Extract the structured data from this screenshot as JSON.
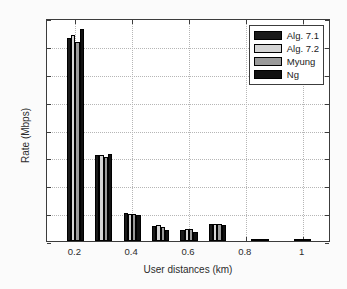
{
  "figure": {
    "width": 347,
    "height": 289,
    "background": "#fbfbfb"
  },
  "chart_data": {
    "type": "bar",
    "title": "",
    "xlabel": "User distances (km)",
    "ylabel": "Rate (Mbps)",
    "xlim": [
      0.1,
      1.1
    ],
    "ylim": [
      0,
      16
    ],
    "yticks": [
      0,
      2,
      4,
      6,
      8,
      10,
      12,
      14,
      16
    ],
    "ytick_labels": [
      "0",
      "2",
      "4",
      "6",
      "8",
      "10",
      "12",
      "14",
      "16"
    ],
    "xticks": [
      0.2,
      0.4,
      0.6,
      0.8,
      1
    ],
    "xtick_labels": [
      "0.2",
      "0.4",
      "0.6",
      "0.8",
      "1"
    ],
    "grid": true,
    "legend_position": "upper right",
    "categories": [
      0.2,
      0.3,
      0.4,
      0.5,
      0.6,
      0.7,
      0.85,
      1.0
    ],
    "series": [
      {
        "name": "Alg. 7.1",
        "color": "#1a1a1a",
        "values": [
          14.6,
          6.15,
          1.98,
          1.05,
          0.82,
          1.22,
          0.16,
          0.1
        ]
      },
      {
        "name": "Alg. 7.2",
        "color": "#d4d4d4",
        "values": [
          14.75,
          6.15,
          1.95,
          1.18,
          0.85,
          1.25,
          0.14,
          0.08
        ]
      },
      {
        "name": "Myung",
        "color": "#9a9a9a",
        "values": [
          14.3,
          6.05,
          1.95,
          1.0,
          0.88,
          1.2,
          0.12,
          0.07
        ]
      },
      {
        "name": "Ng",
        "color": "#111111",
        "values": [
          15.2,
          6.25,
          1.88,
          0.78,
          0.68,
          1.18,
          0.06,
          0.04
        ]
      }
    ]
  },
  "legend": {
    "entries": [
      {
        "label": "Alg. 7.1",
        "color": "#1a1a1a"
      },
      {
        "label": "Alg. 7.2",
        "color": "#d4d4d4"
      },
      {
        "label": "Myung",
        "color": "#9a9a9a"
      },
      {
        "label": "Ng",
        "color": "#111111"
      }
    ]
  }
}
